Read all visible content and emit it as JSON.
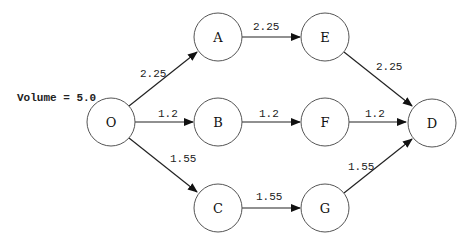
{
  "diagram": {
    "volume_label": "Volume = 5.0",
    "nodes": {
      "O": {
        "label": "O"
      },
      "A": {
        "label": "A"
      },
      "B": {
        "label": "B"
      },
      "C": {
        "label": "C"
      },
      "E": {
        "label": "E"
      },
      "F": {
        "label": "F"
      },
      "G": {
        "label": "G"
      },
      "D": {
        "label": "D"
      }
    },
    "edges": {
      "O_A": {
        "from": "O",
        "to": "A",
        "label": "2.25"
      },
      "O_B": {
        "from": "O",
        "to": "B",
        "label": "1.2"
      },
      "O_C": {
        "from": "O",
        "to": "C",
        "label": "1.55"
      },
      "A_E": {
        "from": "A",
        "to": "E",
        "label": "2.25"
      },
      "B_F": {
        "from": "B",
        "to": "F",
        "label": "1.2"
      },
      "C_G": {
        "from": "C",
        "to": "G",
        "label": "1.55"
      },
      "E_D": {
        "from": "E",
        "to": "D",
        "label": "2.25"
      },
      "F_D": {
        "from": "F",
        "to": "D",
        "label": "1.2"
      },
      "G_D": {
        "from": "G",
        "to": "D",
        "label": "1.55"
      }
    }
  }
}
